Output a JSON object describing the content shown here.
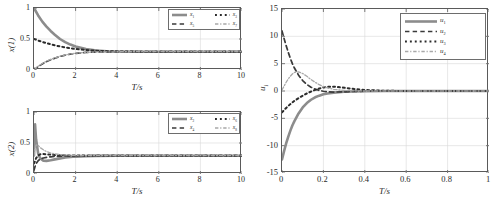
{
  "figure": {
    "background": "#ffffff",
    "axis_color": "#5a5a5a",
    "grid_color": "#d9d9d9",
    "text_color": "#2a2a2a"
  },
  "colors": {
    "series_1": "#8c8c8c",
    "series_2": "#3a3a3a",
    "series_3": "#2b2b2b",
    "series_4": "#a8a8a8"
  },
  "panels": [
    {
      "id": "panel-x1",
      "ylabel": "x(1)",
      "xlabel": "T/s",
      "xticks": [
        "0",
        "2",
        "4",
        "6",
        "8",
        "10"
      ],
      "yticks": [
        "0",
        "0.5",
        "1"
      ],
      "legend": [
        {
          "label": "x",
          "sub": "1",
          "style": "solid",
          "color": "#8c8c8c"
        },
        {
          "label": "x",
          "sub": "3",
          "style": "dotted",
          "color": "#2b2b2b"
        },
        {
          "label": "x",
          "sub": "5",
          "style": "dashed",
          "color": "#3a3a3a"
        },
        {
          "label": "x",
          "sub": "7",
          "style": "dashdot",
          "color": "#a8a8a8"
        }
      ]
    },
    {
      "id": "panel-x2",
      "ylabel": "x(2)",
      "xlabel": "T/s",
      "xticks": [
        "0",
        "2",
        "4",
        "6",
        "8",
        "10"
      ],
      "yticks": [
        "0",
        "0.5",
        "1"
      ],
      "legend": [
        {
          "label": "x",
          "sub": "2",
          "style": "solid",
          "color": "#8c8c8c"
        },
        {
          "label": "x",
          "sub": "6",
          "style": "dotted",
          "color": "#2b2b2b"
        },
        {
          "label": "x",
          "sub": "4",
          "style": "dashed",
          "color": "#3a3a3a"
        },
        {
          "label": "x",
          "sub": "8",
          "style": "dashdot",
          "color": "#a8a8a8"
        }
      ]
    },
    {
      "id": "panel-u",
      "ylabel": "u",
      "ylabel_sub": "i",
      "xlabel": "T/s",
      "xticks": [
        "0",
        "0.2",
        "0.4",
        "0.6",
        "0.8",
        "1"
      ],
      "yticks": [
        "-15",
        "-10",
        "-5",
        "0",
        "5",
        "10",
        "15"
      ],
      "legend": [
        {
          "label": "u",
          "sub": "1",
          "style": "solid",
          "color": "#8c8c8c"
        },
        {
          "label": "u",
          "sub": "2",
          "style": "dashed",
          "color": "#3a3a3a"
        },
        {
          "label": "u",
          "sub": "3",
          "style": "dotted",
          "color": "#2b2b2b"
        },
        {
          "label": "u",
          "sub": "4",
          "style": "dashdot",
          "color": "#a8a8a8"
        }
      ]
    }
  ],
  "chart_data": [
    {
      "type": "line",
      "title": "",
      "xlabel": "T/s",
      "ylabel": "x(1)",
      "xlim": [
        0,
        10
      ],
      "ylim": [
        0,
        1
      ],
      "xticks": [
        0,
        2,
        4,
        6,
        8,
        10
      ],
      "yticks": [
        0,
        0.5,
        1
      ],
      "grid": true,
      "legend_position": "top-right",
      "x": [
        0,
        0.2,
        0.4,
        0.6,
        0.8,
        1.0,
        1.25,
        1.5,
        1.75,
        2.0,
        2.5,
        3.0,
        3.5,
        4.0,
        5.0,
        6.0,
        7.0,
        8.0,
        9.0,
        10.0
      ],
      "series": [
        {
          "name": "x1",
          "style": "solid",
          "color": "#8c8c8c",
          "values": [
            1.0,
            0.88,
            0.78,
            0.7,
            0.63,
            0.57,
            0.5,
            0.45,
            0.41,
            0.38,
            0.34,
            0.315,
            0.303,
            0.298,
            0.295,
            0.295,
            0.295,
            0.295,
            0.295,
            0.295
          ]
        },
        {
          "name": "x3",
          "style": "dotted",
          "color": "#2b2b2b",
          "values": [
            0.5,
            0.475,
            0.453,
            0.433,
            0.415,
            0.398,
            0.38,
            0.364,
            0.35,
            0.339,
            0.322,
            0.311,
            0.304,
            0.3,
            0.296,
            0.295,
            0.295,
            0.295,
            0.295,
            0.295
          ]
        },
        {
          "name": "x5",
          "style": "dashed",
          "color": "#3a3a3a",
          "values": [
            0.0,
            0.055,
            0.098,
            0.135,
            0.165,
            0.19,
            0.218,
            0.24,
            0.256,
            0.268,
            0.283,
            0.29,
            0.293,
            0.294,
            0.295,
            0.295,
            0.295,
            0.295,
            0.295,
            0.295
          ]
        },
        {
          "name": "x7",
          "style": "dashdot",
          "color": "#a8a8a8",
          "values": [
            0.0,
            0.06,
            0.105,
            0.142,
            0.172,
            0.196,
            0.222,
            0.243,
            0.259,
            0.27,
            0.284,
            0.291,
            0.293,
            0.294,
            0.295,
            0.295,
            0.295,
            0.295,
            0.295,
            0.295
          ]
        }
      ]
    },
    {
      "type": "line",
      "title": "",
      "xlabel": "T/s",
      "ylabel": "x(2)",
      "xlim": [
        0,
        10
      ],
      "ylim": [
        0,
        1
      ],
      "xticks": [
        0,
        2,
        4,
        6,
        8,
        10
      ],
      "yticks": [
        0,
        0.5,
        1
      ],
      "grid": true,
      "legend_position": "top-right",
      "x": [
        0,
        0.05,
        0.1,
        0.2,
        0.3,
        0.45,
        0.6,
        0.8,
        1.0,
        1.25,
        1.5,
        2.0,
        2.5,
        3.0,
        4.0,
        5.0,
        6.0,
        8.0,
        10.0
      ],
      "series": [
        {
          "name": "x2",
          "style": "solid",
          "color": "#8c8c8c",
          "values": [
            0.3,
            0.8,
            0.56,
            0.33,
            0.25,
            0.215,
            0.212,
            0.222,
            0.236,
            0.252,
            0.265,
            0.281,
            0.289,
            0.292,
            0.295,
            0.295,
            0.295,
            0.295,
            0.295
          ]
        },
        {
          "name": "x6",
          "style": "dotted",
          "color": "#2b2b2b",
          "values": [
            0.17,
            0.21,
            0.255,
            0.3,
            0.318,
            0.322,
            0.318,
            0.312,
            0.307,
            0.303,
            0.301,
            0.298,
            0.296,
            0.296,
            0.295,
            0.295,
            0.295,
            0.295,
            0.295
          ]
        },
        {
          "name": "x4",
          "style": "dashed",
          "color": "#3a3a3a",
          "values": [
            0.06,
            0.12,
            0.165,
            0.215,
            0.24,
            0.258,
            0.268,
            0.277,
            0.283,
            0.288,
            0.291,
            0.294,
            0.295,
            0.295,
            0.295,
            0.295,
            0.295,
            0.295,
            0.295
          ]
        },
        {
          "name": "x8",
          "style": "dashdot",
          "color": "#a8a8a8",
          "values": [
            0.3,
            0.42,
            0.47,
            0.46,
            0.425,
            0.39,
            0.362,
            0.338,
            0.324,
            0.313,
            0.307,
            0.3,
            0.297,
            0.296,
            0.295,
            0.295,
            0.295,
            0.295,
            0.295
          ]
        }
      ]
    },
    {
      "type": "line",
      "title": "",
      "xlabel": "T/s",
      "ylabel": "u_i",
      "xlim": [
        0,
        1
      ],
      "ylim": [
        -15,
        15
      ],
      "xticks": [
        0,
        0.2,
        0.4,
        0.6,
        0.8,
        1
      ],
      "yticks": [
        -15,
        -10,
        -5,
        0,
        5,
        10,
        15
      ],
      "grid": true,
      "legend_position": "top-right",
      "x": [
        0,
        0.01,
        0.02,
        0.03,
        0.04,
        0.05,
        0.06,
        0.08,
        0.1,
        0.12,
        0.14,
        0.16,
        0.18,
        0.2,
        0.22,
        0.25,
        0.3,
        0.35,
        0.4,
        0.5,
        0.6,
        0.8,
        1.0
      ],
      "series": [
        {
          "name": "u1",
          "style": "solid",
          "color": "#8c8c8c",
          "values": [
            -12.5,
            -11.0,
            -9.6,
            -8.4,
            -7.3,
            -6.3,
            -5.5,
            -4.1,
            -3.0,
            -2.2,
            -1.6,
            -1.15,
            -0.85,
            -0.6,
            -0.45,
            -0.3,
            -0.15,
            -0.08,
            -0.04,
            -0.01,
            0.0,
            0.0,
            0.0
          ]
        },
        {
          "name": "u2",
          "style": "dashed",
          "color": "#3a3a3a",
          "values": [
            11.0,
            9.6,
            8.3,
            7.1,
            6.0,
            5.0,
            4.2,
            2.9,
            1.9,
            1.2,
            0.7,
            0.35,
            0.1,
            -0.05,
            -0.15,
            -0.2,
            -0.15,
            -0.08,
            -0.04,
            -0.01,
            0.0,
            0.0,
            0.0
          ]
        },
        {
          "name": "u3",
          "style": "dotted",
          "color": "#2b2b2b",
          "values": [
            -3.9,
            -3.5,
            -3.1,
            -2.75,
            -2.4,
            -2.1,
            -1.8,
            -1.3,
            -0.85,
            -0.45,
            -0.1,
            0.2,
            0.45,
            0.65,
            0.75,
            0.8,
            0.6,
            0.35,
            0.18,
            0.04,
            0.0,
            0.0,
            0.0
          ]
        },
        {
          "name": "u4",
          "style": "dashdot",
          "color": "#a8a8a8",
          "values": [
            0.2,
            0.9,
            1.6,
            2.2,
            2.7,
            3.1,
            3.4,
            3.5,
            3.2,
            2.7,
            2.1,
            1.6,
            1.15,
            0.8,
            0.55,
            0.3,
            0.1,
            0.03,
            0.0,
            0.0,
            0.0,
            0.0,
            0.0
          ]
        }
      ]
    }
  ]
}
